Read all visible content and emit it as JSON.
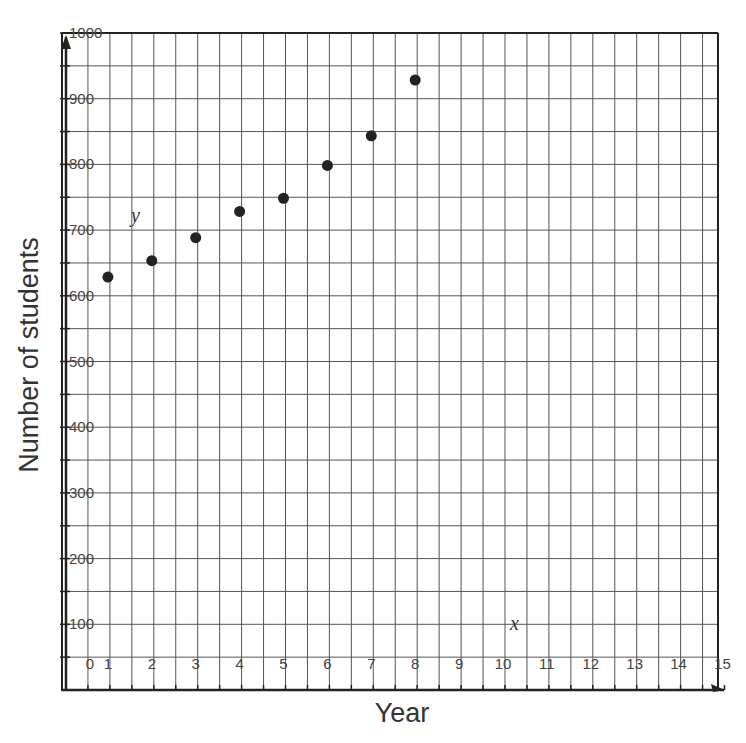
{
  "chart_data": {
    "type": "scatter",
    "title": "",
    "xlabel": "Year",
    "ylabel": "Number of students",
    "x_variable_label": "x",
    "y_variable_label": "y",
    "xlim": [
      0,
      15
    ],
    "ylim": [
      0,
      1000
    ],
    "x_ticks": [
      0,
      1,
      2,
      3,
      4,
      5,
      6,
      7,
      8,
      9,
      10,
      11,
      12,
      13,
      14,
      15
    ],
    "x_tick_labels": [
      "0",
      "1",
      "2",
      "3",
      "4",
      "5",
      "6",
      "7",
      "8",
      "9",
      "10",
      "11",
      "12",
      "13",
      "14",
      "15"
    ],
    "y_ticks": [
      100,
      200,
      300,
      400,
      500,
      600,
      700,
      800,
      900,
      1000
    ],
    "y_tick_labels": [
      "100",
      "200",
      "300",
      "400",
      "500",
      "600",
      "700",
      "800",
      "900",
      "1000"
    ],
    "grid": true,
    "grid_minor_x": 0.5,
    "grid_minor_y": 50,
    "legend": null,
    "series": [
      {
        "name": "Students",
        "x": [
          1,
          2,
          3,
          4,
          5,
          6,
          7,
          8
        ],
        "y": [
          630,
          655,
          690,
          730,
          750,
          800,
          845,
          930
        ]
      }
    ],
    "colors": {
      "point": "#222222",
      "grid": "#555555",
      "axis": "#222222"
    }
  }
}
